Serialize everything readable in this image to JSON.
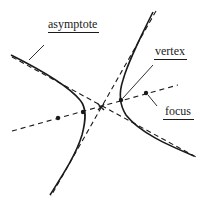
{
  "diagram": {
    "labels": {
      "asymptote": "asymptote",
      "vertex": "vertex",
      "focus": "focus"
    },
    "colors": {
      "ink": "#1a1a1a",
      "background": "#ffffff"
    },
    "elements": [
      {
        "name": "hyperbola-branch-left",
        "type": "curve",
        "style": "solid"
      },
      {
        "name": "hyperbola-branch-right",
        "type": "curve",
        "style": "solid"
      },
      {
        "name": "asymptote-1",
        "type": "line",
        "style": "dashed"
      },
      {
        "name": "asymptote-2",
        "type": "line",
        "style": "dashed"
      },
      {
        "name": "transverse-axis",
        "type": "line",
        "style": "dashed"
      },
      {
        "name": "center",
        "type": "point",
        "marker": "x"
      },
      {
        "name": "vertex-left",
        "type": "point"
      },
      {
        "name": "vertex-right",
        "type": "point"
      },
      {
        "name": "focus-left",
        "type": "point"
      },
      {
        "name": "focus-right",
        "type": "point"
      }
    ]
  }
}
